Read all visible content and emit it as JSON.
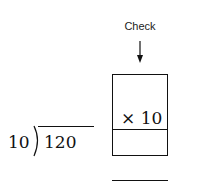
{
  "check": {
    "label": "Check",
    "multiplier": "× 10",
    "answer_blank": ""
  },
  "division": {
    "divisor": "10",
    "dividend": "120",
    "quotient": ""
  }
}
